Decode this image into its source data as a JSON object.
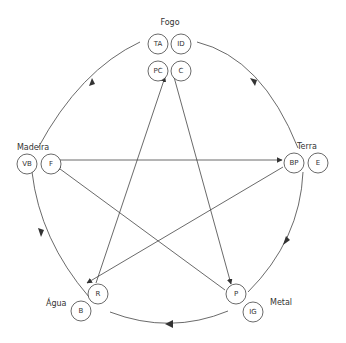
{
  "diagram": {
    "type": "five-elements-cycle",
    "elements": [
      {
        "name": "Fogo",
        "nodes": [
          "TA",
          "ID",
          "PC",
          "C"
        ]
      },
      {
        "name": "Terra",
        "nodes": [
          "BP",
          "E"
        ]
      },
      {
        "name": "Metal",
        "nodes": [
          "P",
          "IG"
        ]
      },
      {
        "name": "Água",
        "nodes": [
          "R",
          "B"
        ]
      },
      {
        "name": "Madeira",
        "nodes": [
          "VB",
          "F"
        ]
      }
    ],
    "cycle_direction": "clockwise: Fogo → Terra → Metal → Água → Madeira → Fogo",
    "star_edges": [
      {
        "from": "C",
        "to": "P"
      },
      {
        "from": "P",
        "to": "VB"
      },
      {
        "from": "F",
        "to": "BP"
      },
      {
        "from": "BP",
        "to": "R"
      },
      {
        "from": "R",
        "to": "PC"
      }
    ],
    "colors": {
      "line": "#444444",
      "text": "#333333",
      "background": "#ffffff"
    }
  }
}
